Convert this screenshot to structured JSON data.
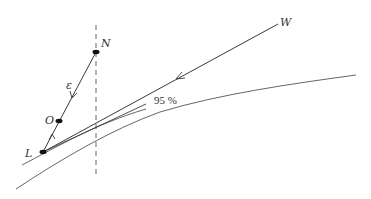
{
  "diagram": {
    "colors": {
      "stroke": "#3a3a3a",
      "curve": "#555555",
      "point": "#111111",
      "text": "#333333"
    },
    "labels": {
      "N": "N",
      "W": "W",
      "O": "O",
      "L": "L",
      "epsilon": "ε",
      "percent": "95 %"
    },
    "points": {
      "N": [
        96,
        52
      ],
      "O": [
        59,
        121
      ],
      "L": [
        43,
        152
      ],
      "W": [
        278,
        24
      ]
    },
    "dashed_line": {
      "x": 96,
      "y1": 25,
      "y2": 178
    }
  }
}
